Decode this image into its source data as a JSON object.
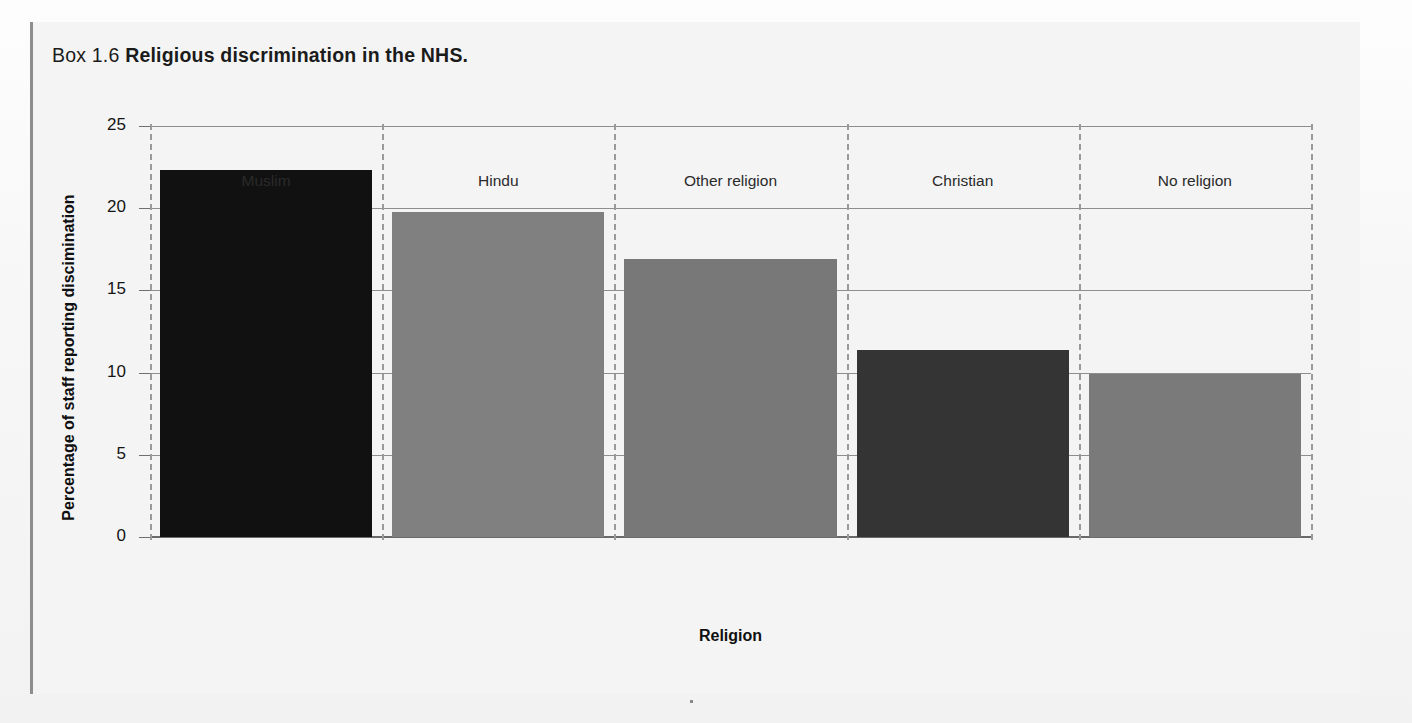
{
  "box": {
    "label": "Box 1.6",
    "title": "Religious discrimination in the NHS."
  },
  "chart_data": {
    "type": "bar",
    "title": "Religious discrimination in the NHS.",
    "categories": [
      "Muslim",
      "Hindu",
      "Other religion",
      "Christian",
      "No religion"
    ],
    "values": [
      22.3,
      19.8,
      16.9,
      11.4,
      9.9
    ],
    "bar_colors": [
      "#111111",
      "#808080",
      "#787878",
      "#343434",
      "#7a7a7a"
    ],
    "xlabel": "Religion",
    "ylabel": "Percentage of staff reporting discimination",
    "ylim": [
      0,
      25
    ],
    "yticks": [
      0,
      5,
      10,
      15,
      20,
      25
    ],
    "ytick_labels": [
      "0",
      "5",
      "10",
      "15",
      "20",
      "25"
    ],
    "grid": true,
    "grid_orientation": "horizontal",
    "category_separators": "dashed-vertical",
    "legend": null,
    "legend_position": "none"
  },
  "colors": {
    "gridline": "#8e8e8e",
    "separator": "#9a9a9a",
    "axis": "#6a6a6a",
    "text": "#141414",
    "box_rule": "#8d8d8d",
    "box_background": "#f4f4f4"
  }
}
